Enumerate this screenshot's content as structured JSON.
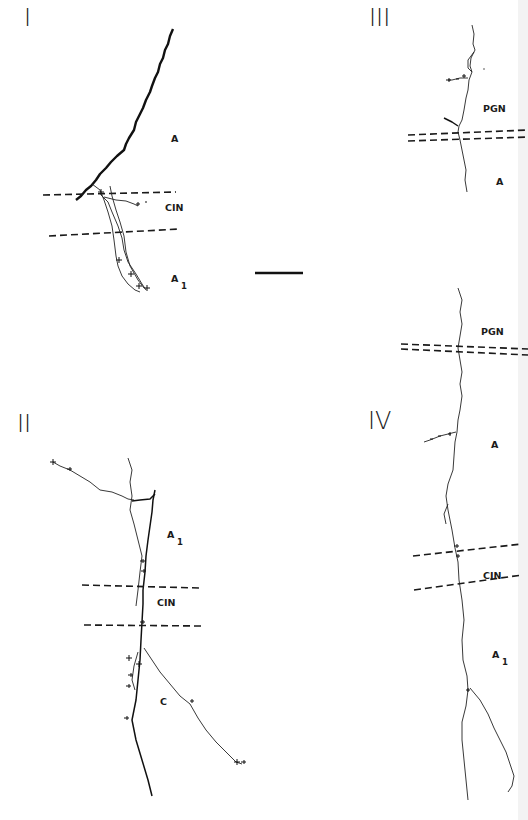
{
  "figure": {
    "panels": [
      {
        "id": "I",
        "roman_label": "I",
        "region_labels": {
          "upper": "A",
          "band": "CIN",
          "lower": "A",
          "lower_sub": "1"
        }
      },
      {
        "id": "II",
        "roman_label": "II",
        "region_labels": {
          "upper": "A",
          "upper_sub": "1",
          "band": "CIN",
          "lower": "C"
        }
      },
      {
        "id": "III",
        "roman_label": "III",
        "region_labels": {
          "upper": "PGN",
          "lower": "A"
        }
      },
      {
        "id": "IV",
        "roman_label": "IV",
        "region_labels": {
          "top": "PGN",
          "upper": "A",
          "band": "CIN",
          "lower": "A",
          "lower_sub": "1"
        }
      }
    ],
    "scale_bar": {
      "label": ""
    }
  }
}
